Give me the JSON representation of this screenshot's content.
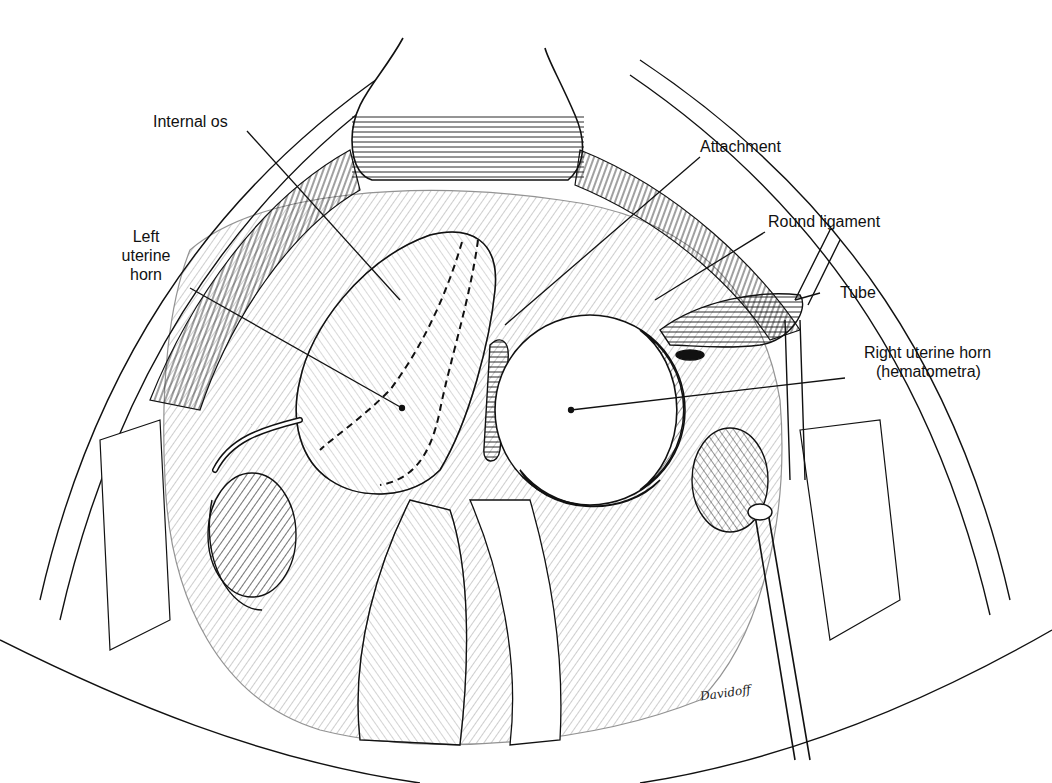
{
  "figure": {
    "type": "surgical anatomy illustration",
    "style": "black ink line drawing on white",
    "ink_color": "#111111",
    "background_color": "#ffffff"
  },
  "labels": {
    "internal_os": "Internal os",
    "left_uterine_horn": [
      "Left",
      "uterine",
      "horn"
    ],
    "attachment": "Attachment",
    "round_ligament": "Round ligament",
    "tube": "Tube",
    "right_uterine_horn": "Right uterine horn",
    "hematometra": "(hematometra)"
  },
  "signature": "Davidoff"
}
